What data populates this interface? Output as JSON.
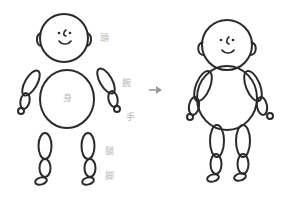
{
  "diagram": {
    "type": "figure-construction",
    "labels": {
      "head": "頭",
      "arm": "腕",
      "body": "身",
      "hand": "手",
      "thigh": "腿",
      "leg": "脚"
    },
    "arrow": "→",
    "colors": {
      "stroke": "#2a2a2a",
      "label": "#b8b8b8",
      "arrow": "#9a9a9a",
      "background": "#ffffff"
    }
  }
}
